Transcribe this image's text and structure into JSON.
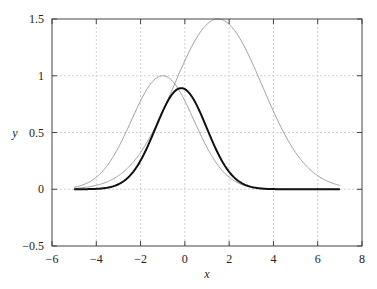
{
  "chart_data": {
    "type": "line",
    "title": "",
    "xlabel": "x",
    "ylabel": "y",
    "xlim": [
      -6,
      8
    ],
    "ylim": [
      -0.5,
      1.5
    ],
    "grid": true,
    "legend": null,
    "x_ticks": [
      -6,
      -4,
      -2,
      0,
      2,
      4,
      6,
      8
    ],
    "x_tick_labels": [
      "−6",
      "−4",
      "−2",
      "0",
      "2",
      "4",
      "6",
      "8"
    ],
    "y_ticks": [
      -0.5,
      0,
      0.5,
      1,
      1.5
    ],
    "y_tick_labels": [
      "−0.5",
      "0",
      "0.5",
      "1",
      "1.5"
    ],
    "x_range_of_curves": [
      -5,
      7
    ],
    "series": [
      {
        "name": "gaussian-a",
        "description": "Gaussian, peak 1 at x=-1, sigma ~1.41",
        "color": "#a0a0a0",
        "width": 1,
        "params": {
          "amplitude": 1.0,
          "mean": -1.0,
          "variance": 2.0
        },
        "x": [
          -5,
          -4,
          -3,
          -2,
          -1,
          0,
          1,
          2,
          3,
          4,
          5,
          6,
          7
        ],
        "values": [
          0.02,
          0.11,
          0.37,
          0.78,
          1.0,
          0.78,
          0.37,
          0.11,
          0.02,
          0.0,
          0.0,
          0.0,
          0.0
        ]
      },
      {
        "name": "gaussian-b",
        "description": "Gaussian, peak 1.5 at x=1.5, sigma 2",
        "color": "#a0a0a0",
        "width": 1,
        "params": {
          "amplitude": 1.5,
          "mean": 1.5,
          "variance": 4.0
        },
        "x": [
          -5,
          -4,
          -3,
          -2,
          -1,
          0,
          1,
          2,
          3,
          4,
          5,
          6,
          7
        ],
        "values": [
          0.01,
          0.03,
          0.12,
          0.32,
          0.69,
          1.13,
          1.45,
          1.45,
          1.13,
          0.69,
          0.32,
          0.12,
          0.03
        ]
      },
      {
        "name": "product",
        "description": "Product of the two gaussians, peak ~0.92 near x=-0.2",
        "color": "#111111",
        "width": 2,
        "params": {
          "product_of": [
            "gaussian-a",
            "gaussian-b"
          ]
        },
        "x": [
          -5,
          -4,
          -3,
          -2,
          -1,
          0,
          1,
          2,
          3,
          4,
          5,
          6,
          7
        ],
        "values": [
          0.0,
          0.0,
          0.04,
          0.25,
          0.69,
          0.88,
          0.54,
          0.16,
          0.02,
          0.0,
          0.0,
          0.0,
          0.0
        ]
      }
    ]
  }
}
